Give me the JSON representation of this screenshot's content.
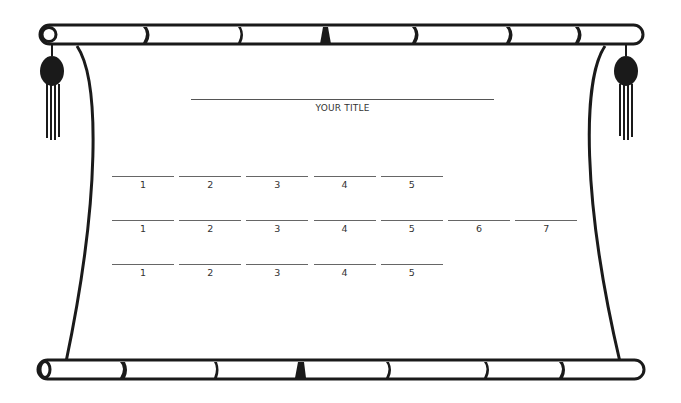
{
  "title": {
    "label": "YOUR TITLE"
  },
  "rows": [
    {
      "top": 176,
      "blanks": [
        "1",
        "2",
        "3",
        "4",
        "5"
      ]
    },
    {
      "top": 220,
      "blanks": [
        "1",
        "2",
        "3",
        "4",
        "5",
        "6",
        "7"
      ]
    },
    {
      "top": 264,
      "blanks": [
        "1",
        "2",
        "3",
        "4",
        "5"
      ]
    }
  ],
  "colors": {
    "ink": "#1a1a1a",
    "text": "#333333",
    "paper": "#ffffff"
  }
}
